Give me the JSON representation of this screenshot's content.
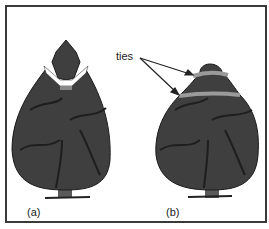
{
  "figure": {
    "annotation": "ties",
    "panels": [
      {
        "label": "(a)",
        "description": "bush with top section cut and tied"
      },
      {
        "label": "(b)",
        "description": "bush with two ties around crown"
      }
    ],
    "colors": {
      "foliage": "#3f3f3f",
      "foliage_dark": "#222222",
      "tie": "#9a9a9a",
      "frame": "#3a3a3a"
    }
  }
}
